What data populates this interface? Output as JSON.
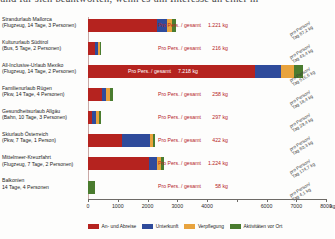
{
  "clipped_header_text": "und für sich beantworten, wenn es um Interesse an einer m",
  "chart_data": {
    "type": "bar",
    "orientation": "horizontal",
    "stacked": true,
    "title": "",
    "xlabel": "kg",
    "ylabel": "",
    "xlim": [
      0,
      8000
    ],
    "xticks": [
      0,
      1000,
      2000,
      3000,
      4000,
      5000,
      6000,
      7000,
      8000
    ],
    "xtick_labels": [
      "0",
      "1000",
      "2000",
      "3000",
      "4000",
      "",
      "6000",
      "7000",
      "8000"
    ],
    "axis_unit": "kg",
    "grid": false,
    "legend_position": "bottom",
    "categories": [
      "Strandurlaub Mallorca",
      "Kultururlaub Südtirol",
      "All-Inclusive-Urlaub Mexiko",
      "Familienurlaub Rügen",
      "Gesundheitsurlaub Allgäu",
      "Skiurlaub Österreich",
      "Mittelmeer-Kreuzfahrt",
      "Balkonien"
    ],
    "series": [
      {
        "name": "An- und Abreise",
        "color": "#b5231f",
        "values": [
          2330,
          230,
          5620,
          470,
          150,
          1150,
          2050,
          0
        ]
      },
      {
        "name": "Unterkunft",
        "color": "#2f4b9b",
        "values": [
          340,
          95,
          880,
          150,
          120,
          930,
          280,
          0
        ]
      },
      {
        "name": "Verpflegung",
        "color": "#e8a33d",
        "values": [
          170,
          85,
          420,
          130,
          90,
          110,
          120,
          0
        ]
      },
      {
        "name": "Aktivitäten vor Ort",
        "color": "#4a7c2f",
        "values": [
          105,
          30,
          300,
          80,
          70,
          60,
          100,
          232
        ]
      }
    ]
  },
  "rows": [
    {
      "name": "Strandurlaub Mallorca",
      "detail": "(Flugzeug, 14 Tage, 3 Personen)",
      "total_prefix": "Pro Pers. / gesamt",
      "total_value": "1.221",
      "unit": "kg",
      "perday_line1": "pro Person/",
      "perday_line2": "Tag 87,2 kg"
    },
    {
      "name": "Kultururlaub Südtirol",
      "detail": "(Bus, 5 Tage, 2 Personen)",
      "total_prefix": "Pro Pers. / gesamt",
      "total_value": "216",
      "unit": "kg",
      "perday_line1": "pro Person/",
      "perday_line2": "Tag 43,4 kg"
    },
    {
      "name": "All-Inclusive-Urlaub Mexiko",
      "detail": "(Flugzeug, 14 Tage, 2 Personen)",
      "total_prefix": "Pro Pers. / gesamt",
      "total_value": "7.218",
      "unit": "kg",
      "perday_line1": "pro Person/",
      "perday_line2": "Tag 515,6 kg"
    },
    {
      "name": "Familienurlaub Rügen",
      "detail": "(Pkw, 14 Tage, 4 Personen)",
      "total_prefix": "Pro Pers. / gesamt",
      "total_value": "258",
      "unit": "kg",
      "perday_line1": "pro Person/",
      "perday_line2": "Tag 18,4 kg"
    },
    {
      "name": "Gesundheitsurlaub Allgäu",
      "detail": "(Bahn, 10 Tage, 3 Personen)",
      "total_prefix": "Pro Pers. / gesamt",
      "total_value": "297",
      "unit": "kg",
      "perday_line1": "pro Person/",
      "perday_line2": "Tag 29,4 kg"
    },
    {
      "name": "Skiurlaub Österreich",
      "detail": "(Pkw, 7 Tage, 1 Person)",
      "total_prefix": "Pro Pers. / gesamt",
      "total_value": "422",
      "unit": "kg",
      "perday_line1": "pro Person/",
      "perday_line2": "Tag 60,3 kg"
    },
    {
      "name": "Mittelmeer-Kreuzfahrt",
      "detail": "(Flugzeug, 7 Tage, 2 Personen)",
      "total_prefix": "Pro Pers. / gesamt",
      "total_value": "1.224",
      "unit": "kg",
      "perday_line1": "pro Person/",
      "perday_line2": "Tag 174,7 kg"
    },
    {
      "name": "Balkonien",
      "detail": "14 Tage, 4 Personen",
      "total_prefix": "Pro Pers. / gesamt",
      "total_value": "58",
      "unit": "kg",
      "perday_line1": "pro Person/",
      "perday_line2": "Tag 4,1 kg"
    }
  ],
  "legend": [
    {
      "label": "An- und Abreise",
      "color": "#b5231f"
    },
    {
      "label": "Unterkunft",
      "color": "#2f4b9b"
    },
    {
      "label": "Verpflegung",
      "color": "#e8a33d"
    },
    {
      "label": "Aktivitäten vor Ort",
      "color": "#4a7c2f"
    }
  ]
}
